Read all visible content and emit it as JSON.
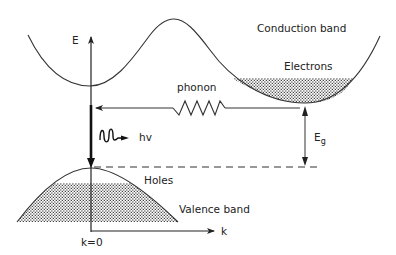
{
  "diagram": {
    "type": "indirect-bandgap energy-momentum (E-k) diagram",
    "labels": {
      "energy_axis": "E",
      "momentum_axis": "k",
      "origin": "k=0",
      "conduction_band": "Conduction band",
      "valence_band": "Valence band",
      "electrons": "Electrons",
      "holes": "Holes",
      "phonon": "phonon",
      "photon": "hv",
      "bandgap_main": "E",
      "bandgap_sub": "g"
    },
    "colors": {
      "line": "#333333",
      "fill_dots": "#555555",
      "background": "#ffffff"
    }
  }
}
